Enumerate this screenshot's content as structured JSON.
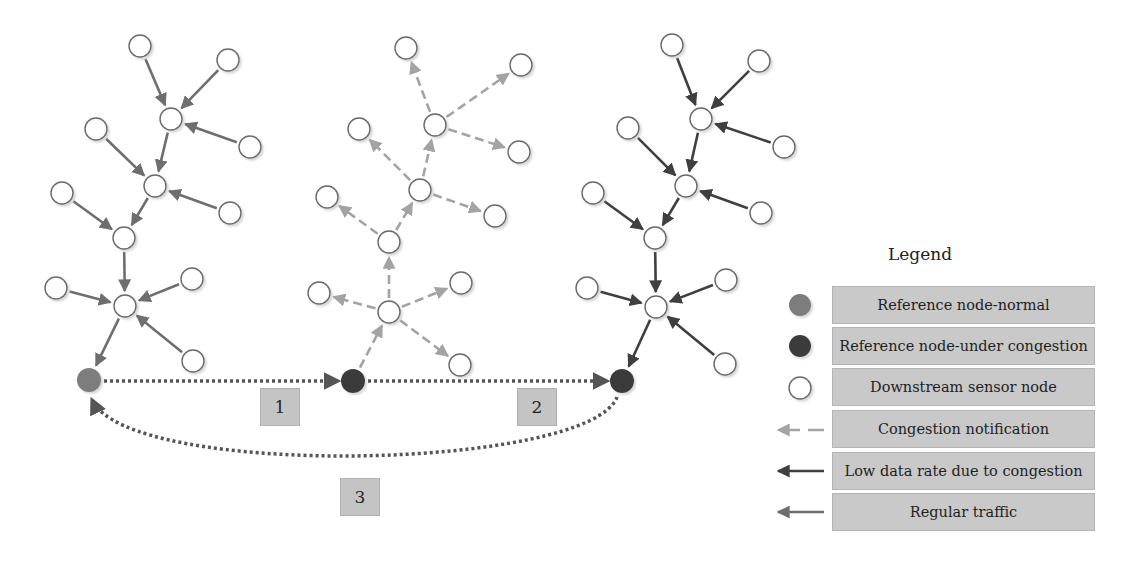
{
  "legend": {
    "title": "Legend",
    "items": [
      {
        "icon": "reference-node-normal-icon",
        "label": "Reference node-normal",
        "color": "#7d7d7d"
      },
      {
        "icon": "reference-node-congested-icon",
        "label": "Reference node-under congestion",
        "color": "#3b3b3b"
      },
      {
        "icon": "sensor-node-icon",
        "label": "Downstream sensor node",
        "color": "#ffffff"
      },
      {
        "icon": "dashed-arrow-icon",
        "label": "Congestion notification",
        "color": "#a0a0a0"
      },
      {
        "icon": "dark-arrow-icon",
        "label": "Low data rate due to congestion",
        "color": "#444444"
      },
      {
        "icon": "gray-arrow-icon",
        "label": "Regular traffic",
        "color": "#6e6e6e"
      }
    ]
  },
  "steps": [
    {
      "label": "1",
      "x": 260,
      "y": 388
    },
    {
      "label": "2",
      "x": 517,
      "y": 388
    },
    {
      "label": "3",
      "x": 340,
      "y": 478
    }
  ],
  "colors": {
    "regular": "#6e6e6e",
    "low_rate": "#3f3f3f",
    "notification": "#a3a3a3",
    "ref_normal": "#7d7d7d",
    "ref_congested": "#3b3b3b",
    "step_box": "#c4c4c4",
    "legend_box": "#c9c9c9"
  },
  "trees": [
    {
      "name": "tree-normal",
      "edge_style": "regular",
      "direction": "inward",
      "ref": {
        "x": 89,
        "y": 380,
        "type": "normal"
      },
      "nodes": [
        {
          "id": "a",
          "x": 140,
          "y": 46
        },
        {
          "id": "b",
          "x": 228,
          "y": 60
        },
        {
          "id": "h1",
          "x": 171,
          "y": 119
        },
        {
          "id": "c",
          "x": 250,
          "y": 147
        },
        {
          "id": "d",
          "x": 96,
          "y": 129
        },
        {
          "id": "h2",
          "x": 155,
          "y": 186
        },
        {
          "id": "e",
          "x": 230,
          "y": 213
        },
        {
          "id": "f",
          "x": 62,
          "y": 193
        },
        {
          "id": "h3",
          "x": 124,
          "y": 238
        },
        {
          "id": "g",
          "x": 56,
          "y": 288
        },
        {
          "id": "h4",
          "x": 125,
          "y": 306
        },
        {
          "id": "i",
          "x": 192,
          "y": 279
        },
        {
          "id": "j",
          "x": 193,
          "y": 361
        }
      ],
      "edges": [
        [
          "a",
          "h1"
        ],
        [
          "b",
          "h1"
        ],
        [
          "c",
          "h1"
        ],
        [
          "h1",
          "h2"
        ],
        [
          "d",
          "h2"
        ],
        [
          "e",
          "h2"
        ],
        [
          "h2",
          "h3"
        ],
        [
          "f",
          "h3"
        ],
        [
          "h3",
          "h4"
        ],
        [
          "g",
          "h4"
        ],
        [
          "i",
          "h4"
        ],
        [
          "j",
          "h4"
        ],
        [
          "h4",
          "REF"
        ]
      ]
    },
    {
      "name": "tree-congested-notify",
      "edge_style": "notification",
      "direction": "outward",
      "ref": {
        "x": 353,
        "y": 381,
        "type": "congested"
      },
      "nodes": [
        {
          "id": "a",
          "x": 406,
          "y": 48
        },
        {
          "id": "b",
          "x": 521,
          "y": 65
        },
        {
          "id": "h1",
          "x": 435,
          "y": 125
        },
        {
          "id": "c",
          "x": 519,
          "y": 152
        },
        {
          "id": "d",
          "x": 359,
          "y": 129
        },
        {
          "id": "h2",
          "x": 420,
          "y": 190
        },
        {
          "id": "e",
          "x": 495,
          "y": 216
        },
        {
          "id": "f",
          "x": 327,
          "y": 197
        },
        {
          "id": "h3",
          "x": 389,
          "y": 242
        },
        {
          "id": "g",
          "x": 319,
          "y": 293
        },
        {
          "id": "h4",
          "x": 389,
          "y": 312
        },
        {
          "id": "i",
          "x": 461,
          "y": 283
        },
        {
          "id": "j",
          "x": 460,
          "y": 365
        }
      ],
      "edges": [
        [
          "a",
          "h1"
        ],
        [
          "b",
          "h1"
        ],
        [
          "c",
          "h1"
        ],
        [
          "h1",
          "h2"
        ],
        [
          "d",
          "h2"
        ],
        [
          "e",
          "h2"
        ],
        [
          "h2",
          "h3"
        ],
        [
          "f",
          "h3"
        ],
        [
          "h3",
          "h4"
        ],
        [
          "g",
          "h4"
        ],
        [
          "i",
          "h4"
        ],
        [
          "j",
          "h4"
        ],
        [
          "h4",
          "REF"
        ]
      ]
    },
    {
      "name": "tree-low-rate",
      "edge_style": "low_rate",
      "direction": "inward",
      "ref": {
        "x": 622,
        "y": 381,
        "type": "congested"
      },
      "nodes": [
        {
          "id": "a",
          "x": 672,
          "y": 45
        },
        {
          "id": "b",
          "x": 759,
          "y": 61
        },
        {
          "id": "h1",
          "x": 701,
          "y": 119
        },
        {
          "id": "c",
          "x": 784,
          "y": 147
        },
        {
          "id": "d",
          "x": 628,
          "y": 128
        },
        {
          "id": "h2",
          "x": 686,
          "y": 186
        },
        {
          "id": "e",
          "x": 761,
          "y": 213
        },
        {
          "id": "f",
          "x": 593,
          "y": 193
        },
        {
          "id": "h3",
          "x": 655,
          "y": 238
        },
        {
          "id": "g",
          "x": 587,
          "y": 288
        },
        {
          "id": "h4",
          "x": 656,
          "y": 307
        },
        {
          "id": "i",
          "x": 726,
          "y": 280
        },
        {
          "id": "j",
          "x": 725,
          "y": 364
        }
      ],
      "edges": [
        [
          "a",
          "h1"
        ],
        [
          "b",
          "h1"
        ],
        [
          "c",
          "h1"
        ],
        [
          "h1",
          "h2"
        ],
        [
          "d",
          "h2"
        ],
        [
          "e",
          "h2"
        ],
        [
          "h2",
          "h3"
        ],
        [
          "f",
          "h3"
        ],
        [
          "h3",
          "h4"
        ],
        [
          "g",
          "h4"
        ],
        [
          "i",
          "h4"
        ],
        [
          "j",
          "h4"
        ],
        [
          "h4",
          "REF"
        ]
      ]
    }
  ],
  "links": [
    {
      "name": "link-1",
      "from": [
        104,
        381
      ],
      "to": [
        338,
        381
      ]
    },
    {
      "name": "link-2",
      "from": [
        368,
        381
      ],
      "to": [
        607,
        381
      ]
    },
    {
      "name": "link-3-return",
      "path": "M 617 397 C 590 470, 130 480, 92 400"
    }
  ]
}
